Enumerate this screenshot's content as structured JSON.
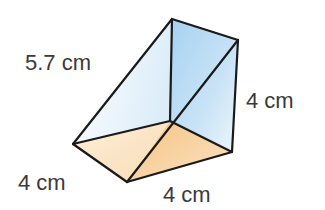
{
  "figure": {
    "type": "triangular-prism",
    "labels": {
      "slant_edge": "5.7 cm",
      "vertical_edge": "4 cm",
      "left_base_edge": "4 cm",
      "bottom_base_edge": "4 cm"
    },
    "colors": {
      "edge": "#1a1a1a",
      "base_light": "#fbe3c3",
      "base_dark": "#f6c98e",
      "face_blue_light": "#e4f1fb",
      "face_blue": "#a9d3f0",
      "label": "#3a3a3a"
    }
  }
}
